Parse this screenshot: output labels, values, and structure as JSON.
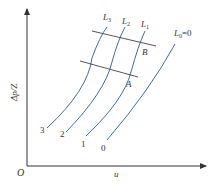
{
  "diagram": {
    "type": "characteristic-curves",
    "axes": {
      "origin_label": "O",
      "x_label": "u",
      "y_label": "Δp/Z"
    },
    "curves": [
      {
        "id": "3",
        "end_label": "3",
        "top_label": "L",
        "top_sub": "3"
      },
      {
        "id": "2",
        "end_label": "2",
        "top_label": "L",
        "top_sub": "2"
      },
      {
        "id": "1",
        "end_label": "1",
        "top_label": "L",
        "top_sub": "1"
      },
      {
        "id": "0",
        "end_label": "0",
        "top_label": "L",
        "top_sub": "0",
        "top_suffix": "=0"
      }
    ],
    "cross_lines": [
      {
        "id": "upper",
        "point_label": "B"
      },
      {
        "id": "lower",
        "point_label": "A"
      }
    ],
    "colors": {
      "curve": "#3a6ea5",
      "axis": "#333333",
      "cross_line": "#444444"
    }
  }
}
